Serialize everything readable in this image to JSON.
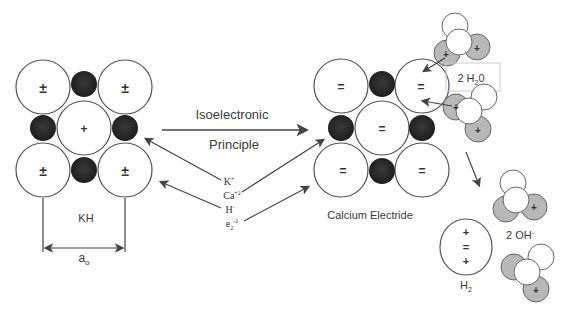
{
  "diagram": {
    "center_arrow_top_label": "Isoelectronic",
    "center_arrow_bottom_label": "Principle",
    "kh_label": "KH",
    "lattice_param_label": "a",
    "lattice_param_sub": "o",
    "electride_label": "Calcium Electride",
    "water_label": "2 H",
    "water_sub": "2",
    "water_tail": "0",
    "hydroxide_label": "2 OH",
    "hydroxide_sup": "-",
    "hydrogen_label": "H",
    "hydrogen_sub": "2",
    "substitutions": {
      "k": "K",
      "k_sup": "+",
      "ca": "Ca",
      "ca_sup": "+2",
      "h": "H",
      "h_sup": "-",
      "e": "e",
      "e_sub": "2",
      "e_sup": "-2"
    },
    "kh_corner_charge": "±",
    "kh_center_charge": "+",
    "electride_charge": "=",
    "h2_charges": [
      "+",
      "=",
      "+"
    ],
    "colors": {
      "anion_fill": "#2b2b2b",
      "cation_fill": "#ffffff",
      "oxygen_fill": "#b8b8b8",
      "stroke": "#555555",
      "arrow": "#444444"
    }
  }
}
